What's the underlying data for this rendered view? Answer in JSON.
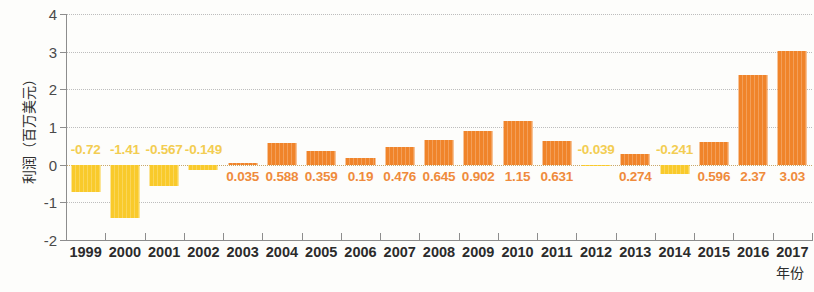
{
  "chart_data": {
    "type": "bar",
    "title": "",
    "xlabel": "年份",
    "ylabel": "利润（百万美元）",
    "categories": [
      "1999",
      "2000",
      "2001",
      "2002",
      "2003",
      "2004",
      "2005",
      "2006",
      "2007",
      "2008",
      "2009",
      "2010",
      "2011",
      "2012",
      "2013",
      "2014",
      "2015",
      "2016",
      "2017"
    ],
    "values": [
      -0.72,
      -1.41,
      -0.567,
      -0.149,
      0.035,
      0.588,
      0.359,
      0.19,
      0.476,
      0.645,
      0.902,
      1.15,
      0.631,
      -0.039,
      0.274,
      -0.241,
      0.596,
      2.37,
      3.03
    ],
    "value_labels": [
      "-0.72",
      "-1.41",
      "-0.567",
      "-0.149",
      "0.035",
      "0.588",
      "0.359",
      "0.19",
      "0.476",
      "0.645",
      "0.902",
      "1.15",
      "0.631",
      "-0.039",
      "0.274",
      "-0.241",
      "0.596",
      "2.37",
      "3.03"
    ],
    "ylim": [
      -2,
      4
    ],
    "yticks": [
      4,
      3,
      2,
      1,
      0,
      -1,
      -2
    ],
    "ytick_labels": [
      "4",
      "3",
      "2",
      "1",
      "0",
      "-1",
      "-2"
    ],
    "grid": true,
    "legend": "none",
    "colors": {
      "positive_bar": "#f0842a",
      "negative_bar": "#f9ca2b",
      "positive_label": "#ef8b3c",
      "negative_label": "#f3cd52",
      "gridline": "#bdbdbd",
      "axis": "#8d8d8d",
      "background": "#fdfdfb",
      "tick_text": "#4a4a4a",
      "category_text": "#2b2b2b"
    }
  }
}
